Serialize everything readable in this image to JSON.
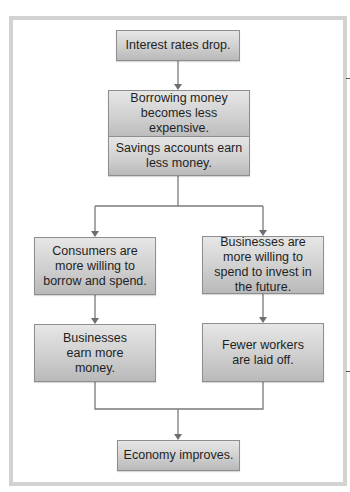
{
  "diagram": {
    "type": "flowchart",
    "nodes": {
      "start": "Interest rates drop.",
      "effect_borrowing": "Borrowing money becomes less expensive.",
      "effect_savings": "Savings accounts earn less money.",
      "consumers": "Consumers are more willing to borrow and spend.",
      "businesses_invest": "Businesses are more willing to spend to invest in the future.",
      "businesses_earn": "Businesses earn more money.",
      "fewer_layoffs": "Fewer workers are laid off.",
      "end": "Economy improves."
    },
    "edges": [
      [
        "start",
        "effect_borrowing"
      ],
      [
        "effect_savings",
        "consumers"
      ],
      [
        "effect_savings",
        "businesses_invest"
      ],
      [
        "consumers",
        "businesses_earn"
      ],
      [
        "businesses_invest",
        "fewer_layoffs"
      ],
      [
        "businesses_earn",
        "end"
      ],
      [
        "fewer_layoffs",
        "end"
      ]
    ],
    "colors": {
      "box_top": "#e6e6e6",
      "box_bottom": "#b9b9b9",
      "box_border": "#8e8e8e",
      "connector": "#707070",
      "frame": "#d2d2d2"
    }
  }
}
